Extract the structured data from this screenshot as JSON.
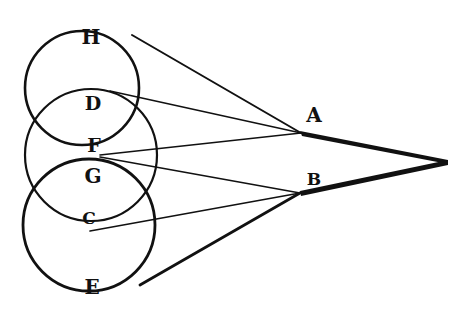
{
  "diagram": {
    "type": "geometric optics figure",
    "labels": {
      "H": "H",
      "D": "D",
      "F": "F",
      "G": "G",
      "C": "C",
      "E": "E",
      "A": "A",
      "B": "B"
    },
    "circles": [
      {
        "name": "upper-circle",
        "cx": 82,
        "cy": 88,
        "r": 57
      },
      {
        "name": "middle-circle",
        "cx": 91,
        "cy": 155,
        "r": 66
      },
      {
        "name": "lower-circle",
        "cx": 89,
        "cy": 225,
        "r": 66
      }
    ],
    "points": {
      "A": [
        301,
        133
      ],
      "B": [
        300,
        193
      ],
      "apex": [
        448,
        162
      ]
    },
    "colors": {
      "ink": "#111111",
      "paper": "#ffffff"
    }
  }
}
